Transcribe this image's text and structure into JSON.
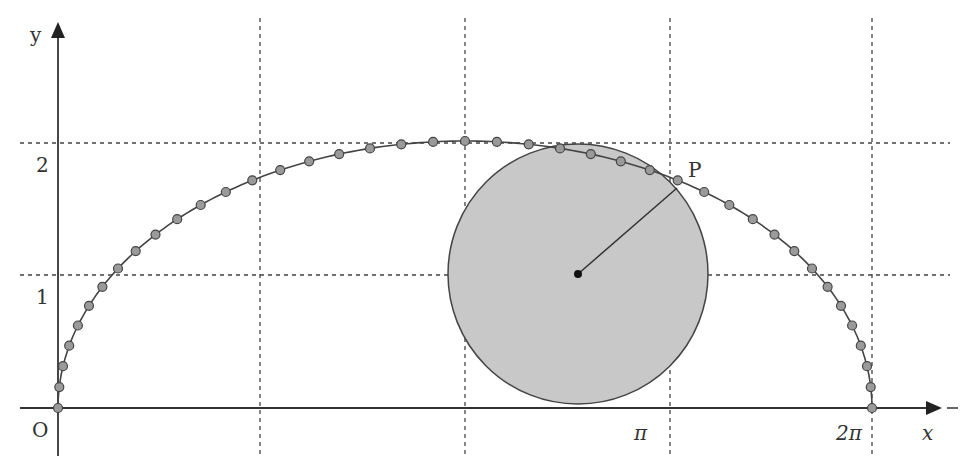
{
  "figure": {
    "labels": {
      "y_axis": "y",
      "x_axis": "x",
      "origin": "O",
      "tick_y_1": "1",
      "tick_y_2": "2",
      "tick_x_pi": "π",
      "tick_x_2pi": "2π",
      "point": "P"
    },
    "colors": {
      "axis": "#333333",
      "grid": "#444444",
      "circle_fill": "#c8c8c8",
      "circle_stroke": "#444444",
      "marker_fill": "#9a9a9a",
      "marker_stroke": "#444444",
      "curve": "#444444"
    }
  },
  "chart_data": {
    "type": "line",
    "title": "",
    "xlabel": "x",
    "ylabel": "y",
    "x_ticks": [
      "π",
      "2π"
    ],
    "y_ticks": [
      "1",
      "2"
    ],
    "xlim": [
      0,
      6.4
    ],
    "ylim": [
      0,
      2.3
    ],
    "grid": "dashed at y=1, y=2 and vertical lines at quarter periods",
    "circle": {
      "center": [
        4.1,
        1
      ],
      "radius": 1
    },
    "point_P": [
      3.83,
      1.65
    ]
  }
}
